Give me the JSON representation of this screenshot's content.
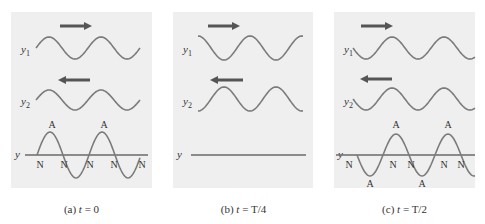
{
  "colors": {
    "panel_bg": "#efefef",
    "wave": "#7b7b7b",
    "axis": "#6a6a6a",
    "arrow": "#555555",
    "text": "#333333"
  },
  "labels": {
    "y1": "y",
    "y1_sub": "1",
    "y2": "y",
    "y2_sub": "2",
    "y": "y",
    "node": "N",
    "antinode": "A"
  },
  "panels": [
    {
      "id": "a",
      "caption_prefix": "(a) ",
      "caption_var": "t",
      "caption_rest": " = 0",
      "caption": "(a) t = 0",
      "x": 11,
      "width": 141,
      "arrows": [
        {
          "dir": "right",
          "x1": 60,
          "x2": 92,
          "y": 26
        },
        {
          "dir": "left",
          "x1": 58,
          "x2": 90,
          "y": 80
        }
      ],
      "y1": {
        "x0": 36,
        "x1": 140,
        "mid": 48,
        "amp": 11,
        "phase": "sin"
      },
      "y2": {
        "x0": 36,
        "x1": 140,
        "mid": 100,
        "amp": 10,
        "phase": "sin"
      },
      "resultant": {
        "x0": 37,
        "x1": 140,
        "mid": 155,
        "amp": 23,
        "phase": "sin",
        "flat": false
      },
      "axis": {
        "x1": 25,
        "x2": 148,
        "y": 155
      },
      "nodes": [
        40,
        64,
        90,
        114,
        142
      ],
      "antinodes_top": [
        52,
        104
      ],
      "antinodes_bottom": []
    },
    {
      "id": "b",
      "caption_prefix": "(b) ",
      "caption_var": "t",
      "caption_rest": " = T/4",
      "caption": "(b) t = T/4",
      "x": 173,
      "width": 140,
      "arrows": [
        {
          "dir": "right",
          "x1": 208,
          "x2": 240,
          "y": 26
        },
        {
          "dir": "left",
          "x1": 210,
          "x2": 243,
          "y": 80
        }
      ],
      "y1": {
        "x0": 198,
        "x1": 303,
        "mid": 48,
        "amp": 12,
        "phase": "cos"
      },
      "y2": {
        "x0": 198,
        "x1": 303,
        "mid": 99,
        "amp": 12,
        "phase": "-cos"
      },
      "resultant": {
        "x0": 191,
        "x1": 306,
        "mid": 155,
        "amp": 0,
        "phase": "flat",
        "flat": true
      },
      "axis": {
        "x1": 191,
        "x2": 306,
        "y": 155
      },
      "nodes": [],
      "antinodes_top": [],
      "antinodes_bottom": []
    },
    {
      "id": "c",
      "caption_prefix": "(c) ",
      "caption_var": "t",
      "caption_rest": " = T/2",
      "caption": "(c) t = T/2",
      "x": 334,
      "width": 141,
      "arrows": [
        {
          "dir": "right",
          "x1": 361,
          "x2": 393,
          "y": 26
        },
        {
          "dir": "left",
          "x1": 360,
          "x2": 392,
          "y": 79
        }
      ],
      "y1": {
        "x0": 353,
        "x1": 475,
        "mid": 48,
        "amp": 11,
        "phase": "-sin"
      },
      "y2": {
        "x0": 353,
        "x1": 475,
        "mid": 99,
        "amp": 11,
        "phase": "-sin"
      },
      "resultant": {
        "x0": 357,
        "x1": 475,
        "mid": 155,
        "amp": 21,
        "phase": "-sin",
        "flat": false
      },
      "axis": {
        "x1": 336,
        "x2": 475,
        "y": 155
      },
      "nodes": [
        349,
        393,
        411,
        444,
        461
      ],
      "antinodes_top": [
        396,
        448
      ],
      "antinodes_bottom": [
        370,
        422
      ]
    }
  ],
  "wavelength_px": 52
}
